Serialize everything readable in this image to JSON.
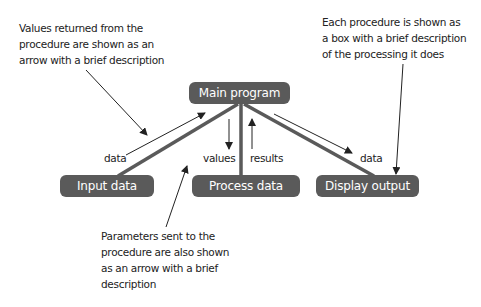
{
  "diagram": {
    "type": "structure-chart",
    "colors": {
      "box_fill": "#5a5a5a",
      "box_text": "#ffffff",
      "connector": "#5a5a5a",
      "arrow": "#222222",
      "text": "#222222"
    },
    "nodes": {
      "main": {
        "label": "Main program"
      },
      "input": {
        "label": "Input data"
      },
      "process": {
        "label": "Process data"
      },
      "display": {
        "label": "Display output"
      }
    },
    "flows": {
      "input_to_main": {
        "label": "data",
        "direction": "up"
      },
      "main_to_process": {
        "label": "values",
        "direction": "down"
      },
      "process_to_main": {
        "label": "results",
        "direction": "up"
      },
      "main_to_display": {
        "label": "data",
        "direction": "down"
      }
    },
    "annotations": {
      "returned_values": {
        "lines": [
          "Values returned from the",
          "procedure are shown as an",
          "arrow with a brief description"
        ]
      },
      "procedure_box": {
        "lines": [
          "Each procedure is shown as",
          "a box with a brief description",
          "of the processing it does"
        ]
      },
      "parameters": {
        "lines": [
          "Parameters sent to the",
          "procedure are also shown",
          "as an arrow with a brief",
          "description"
        ]
      }
    }
  }
}
